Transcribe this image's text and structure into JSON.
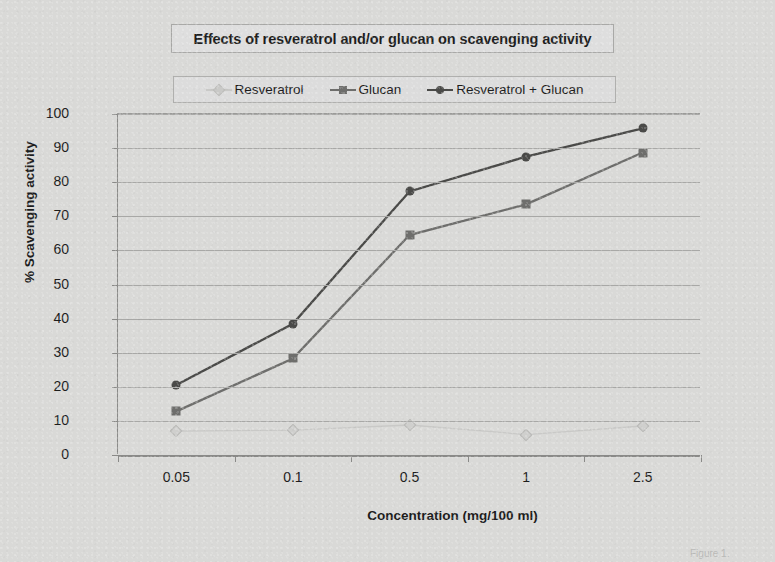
{
  "chart_data": {
    "type": "line",
    "title": "Effects of resveratrol and/or glucan on scavenging activity",
    "xlabel": "Concentration (mg/100 ml)",
    "ylabel": "% Scavenging activity",
    "categories": [
      "0.05",
      "0.1",
      "0.5",
      "1",
      "2.5"
    ],
    "ylim": [
      0,
      100
    ],
    "ytick_step": 10,
    "yticks": [
      "100",
      "90",
      "80",
      "70",
      "60",
      "50",
      "40",
      "30",
      "20",
      "10",
      "0"
    ],
    "grid": "horizontal",
    "legend_position": "top",
    "series": [
      {
        "name": "Resveratrol",
        "values": [
          7,
          7.3,
          8.8,
          6,
          8.5
        ],
        "color": "#c9c9c7",
        "marker": "diamond"
      },
      {
        "name": "Glucan",
        "values": [
          12.8,
          28.3,
          64.5,
          73.5,
          88.7
        ],
        "color": "#6e6e6c",
        "marker": "square"
      },
      {
        "name": "Resveratrol + Glucan",
        "values": [
          20.5,
          38.5,
          77.3,
          87.5,
          95.8
        ],
        "color": "#4a4a48",
        "marker": "circle"
      }
    ]
  },
  "figure": {
    "caption": "Figure 1."
  }
}
